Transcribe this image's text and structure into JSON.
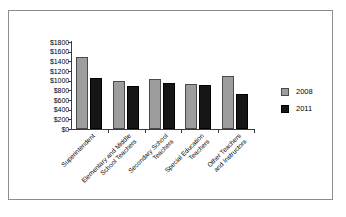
{
  "chart_data": {
    "type": "bar",
    "title": "",
    "subtitle": "",
    "xlabel": "",
    "ylabel": "",
    "ylim": [
      0,
      1800
    ],
    "grid": false,
    "legend_position": "right",
    "y_tick_labels": [
      "$1800",
      "$1600",
      "$1400",
      "$1200",
      "$1000",
      "$800",
      "$600",
      "$400",
      "$200",
      "$0"
    ],
    "y_tick_values": [
      1800,
      1600,
      1400,
      1200,
      1000,
      800,
      600,
      400,
      200,
      0
    ],
    "categories": [
      "Superintendent",
      "Elementary and Middle School Teachers",
      "Secondary School Teachers",
      "Special Education Teachers",
      "Other Teachers and Instructors"
    ],
    "category_lines": [
      [
        "Superintendent"
      ],
      [
        "Elementary and Middle",
        "School Teachers"
      ],
      [
        "Secondary School",
        "Teachers"
      ],
      [
        "Special Education",
        "Teachers"
      ],
      [
        "Other Teachers",
        "and Instructors"
      ]
    ],
    "series": [
      {
        "name": "2008",
        "color": "#9d9d9d",
        "values": [
          1500,
          1000,
          1030,
          940,
          1090
        ]
      },
      {
        "name": "2011",
        "color": "#161616",
        "values": [
          1050,
          900,
          960,
          910,
          730
        ]
      }
    ]
  },
  "legend": {
    "items": [
      {
        "label": "2008",
        "color": "#9d9d9d"
      },
      {
        "label": "2011",
        "color": "#161616"
      }
    ]
  }
}
